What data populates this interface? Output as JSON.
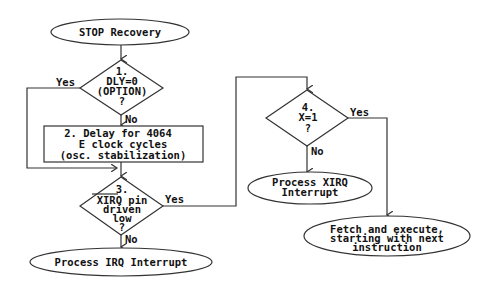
{
  "diagram": {
    "type": "flowchart",
    "nodes": {
      "start": {
        "shape": "ellipse",
        "lines": [
          "STOP Recovery"
        ]
      },
      "d1": {
        "shape": "diamond",
        "lines": [
          "1.",
          "DLY=0",
          "(OPTION)",
          "?"
        ]
      },
      "box2": {
        "shape": "rect",
        "lines": [
          "2. Delay for 4064",
          "E clock cycles",
          "(osc. stabilization)"
        ]
      },
      "d3": {
        "shape": "diamond",
        "lines": [
          "3.",
          "XIRQ pin",
          "driven",
          "low",
          "?"
        ],
        "overline": "XIRQ"
      },
      "irq": {
        "shape": "ellipse",
        "lines": [
          "Process IRQ Interrupt"
        ]
      },
      "d4": {
        "shape": "diamond",
        "lines": [
          "4.",
          "X=1",
          "?"
        ]
      },
      "xirq": {
        "shape": "ellipse",
        "lines": [
          "Process XIRQ",
          "Interrupt"
        ]
      },
      "fetch": {
        "shape": "ellipse",
        "lines": [
          "Fetch and execute,",
          "starting with next",
          "instruction"
        ]
      }
    },
    "edges": [
      {
        "from": "start",
        "to": "d1",
        "label": ""
      },
      {
        "from": "d1",
        "to": "box2",
        "label": "No"
      },
      {
        "from": "d1",
        "to": "d3",
        "label": "Yes"
      },
      {
        "from": "box2",
        "to": "d3",
        "label": ""
      },
      {
        "from": "d3",
        "to": "irq",
        "label": "No"
      },
      {
        "from": "d3",
        "to": "d4",
        "label": "Yes"
      },
      {
        "from": "d4",
        "to": "xirq",
        "label": "No"
      },
      {
        "from": "d4",
        "to": "fetch",
        "label": "Yes"
      }
    ],
    "labels": {
      "yes": "Yes",
      "no": "No"
    }
  }
}
